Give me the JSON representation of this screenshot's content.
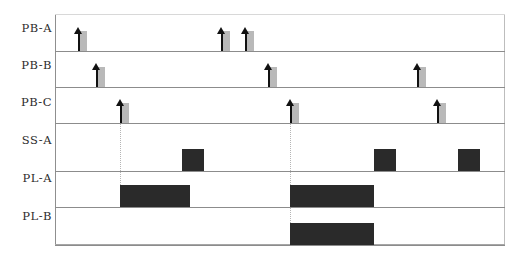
{
  "figure": {
    "width": 518,
    "height": 262,
    "background_color": "#ffffff",
    "frame_color": "#8c8c8c",
    "event_marker_color": "#111111",
    "event_shadow_color": "#b9b9b9",
    "pulse_color": "#2a2a2a",
    "guide_color": "#b5b5b5"
  },
  "rows": [
    {
      "label": "PB-A",
      "label_y": 28,
      "baseline_y": 51,
      "type": "event"
    },
    {
      "label": "PB-B",
      "label_y": 65,
      "baseline_y": 87,
      "type": "event"
    },
    {
      "label": "PB-C",
      "label_y": 102,
      "baseline_y": 123,
      "type": "event"
    },
    {
      "label": "SS-A",
      "label_y": 140,
      "baseline_y": 171,
      "type": "pulse"
    },
    {
      "label": "PL-A",
      "label_y": 178,
      "baseline_y": 207,
      "type": "pulse"
    },
    {
      "label": "PL-B",
      "label_y": 216,
      "baseline_y": 245,
      "type": "pulse"
    }
  ],
  "events": {
    "PB-A": [
      {
        "x": 78
      },
      {
        "x": 221
      },
      {
        "x": 245
      }
    ],
    "PB-B": [
      {
        "x": 96
      },
      {
        "x": 268
      },
      {
        "x": 417
      }
    ],
    "PB-C": [
      {
        "x": 120
      },
      {
        "x": 290
      },
      {
        "x": 437
      }
    ]
  },
  "pulses": {
    "SS-A": [
      {
        "x_start": 182,
        "x_end": 204
      },
      {
        "x_start": 374,
        "x_end": 396
      },
      {
        "x_start": 458,
        "x_end": 480
      }
    ],
    "PL-A": [
      {
        "x_start": 120,
        "x_end": 190
      },
      {
        "x_start": 290,
        "x_end": 374
      }
    ],
    "PL-B": [
      {
        "x_start": 290,
        "x_end": 374
      }
    ]
  },
  "guides": [
    {
      "x": 120,
      "y_top": 110,
      "y_bottom": 207
    },
    {
      "x": 290,
      "y_top": 110,
      "y_bottom": 245
    }
  ],
  "geometry": {
    "plot_left": 55,
    "plot_right": 505,
    "plot_top": 14,
    "plot_bottom": 245,
    "event_height": 24,
    "pulse_height": 22
  },
  "chart_data": {
    "type": "timing-diagram",
    "title": "",
    "xlabel": "",
    "ylabel": "",
    "grid": false,
    "legend": "none",
    "channels": [
      "PB-A",
      "PB-B",
      "PB-C",
      "SS-A",
      "PL-A",
      "PL-B"
    ],
    "series": [
      {
        "name": "PB-A",
        "kind": "event",
        "values": [
          78,
          221,
          245
        ]
      },
      {
        "name": "PB-B",
        "kind": "event",
        "values": [
          96,
          268,
          417
        ]
      },
      {
        "name": "PB-C",
        "kind": "event",
        "values": [
          120,
          290,
          437
        ]
      },
      {
        "name": "SS-A",
        "kind": "pulse",
        "intervals": [
          [
            182,
            204
          ],
          [
            374,
            396
          ],
          [
            458,
            480
          ]
        ]
      },
      {
        "name": "PL-A",
        "kind": "pulse",
        "intervals": [
          [
            120,
            190
          ],
          [
            290,
            374
          ]
        ]
      },
      {
        "name": "PL-B",
        "kind": "pulse",
        "intervals": [
          [
            290,
            374
          ]
        ]
      }
    ]
  }
}
